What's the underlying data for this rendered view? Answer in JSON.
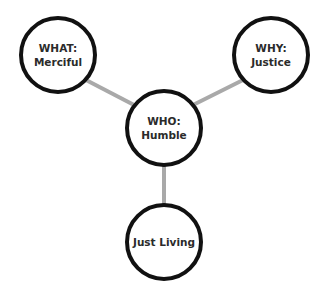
{
  "diagram": {
    "colors": {
      "node_stroke": "#111111",
      "node_fill": "#ffffff",
      "connector": "#a9a9a9",
      "text": "#2b2b2b"
    },
    "nodes": [
      {
        "id": "what",
        "lines": [
          "WHAT:",
          "Merciful"
        ]
      },
      {
        "id": "why",
        "lines": [
          "WHY:",
          "Justice"
        ]
      },
      {
        "id": "who",
        "lines": [
          "WHO:",
          "Humble"
        ]
      },
      {
        "id": "just-living",
        "lines": [
          "Just Living"
        ]
      }
    ],
    "edges": [
      {
        "from": "who",
        "to": "what"
      },
      {
        "from": "who",
        "to": "why"
      },
      {
        "from": "who",
        "to": "just-living"
      }
    ]
  }
}
